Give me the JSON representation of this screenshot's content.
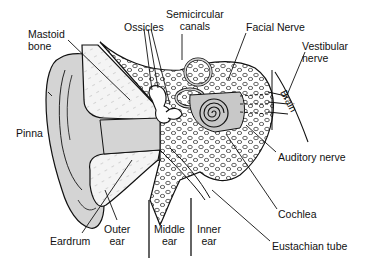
{
  "diagram": {
    "labels": {
      "mastoid_bone": "Mastoid\nbone",
      "ossicles": "Ossicles",
      "semicircular_canals": "Semicircular\ncanals",
      "facial_nerve": "Facial Nerve",
      "vestibular_nerve": "Vestibular\nnerve",
      "brain": "Brain",
      "pinna": "Pinna",
      "auditory_nerve": "Auditory nerve",
      "cochlea": "Cochlea",
      "eustachian_tube": "Eustachian tube",
      "eardrum": "Eardrum",
      "outer_ear": "Outer\near",
      "middle_ear": "Middle\near",
      "inner_ear": "Inner\near"
    },
    "colors": {
      "line": "#111111",
      "fill_gray": "#d4d4d4",
      "bone_fill": "#f2f2f2",
      "background": "#ffffff"
    }
  }
}
